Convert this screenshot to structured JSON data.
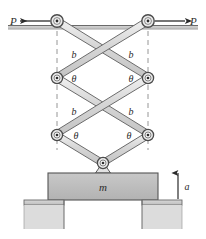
{
  "figure": {
    "labels": {
      "force_left": "P",
      "force_right": "P",
      "link_length": "b",
      "angle": "θ",
      "mass": "m",
      "acceleration": "a"
    },
    "annotations": {
      "b_labels": [
        "b",
        "b",
        "b",
        "b"
      ],
      "theta_labels": [
        "θ",
        "θ",
        "θ",
        "θ"
      ],
      "force_labels": [
        "P",
        "P"
      ]
    },
    "colors": {
      "link_fill": "#d3d3d3",
      "link_stroke": "#6b6b6b",
      "block_fill": "#b9b9b9",
      "block_stroke": "#555555",
      "ground_fill": "#c9c9c9",
      "ground_stroke": "#666666",
      "ink": "#2b2b2b",
      "dashed": "#8a8a8a",
      "background": "#ffffff"
    },
    "geometry": {
      "top_joints": [
        [
          57,
          21
        ],
        [
          148,
          21
        ]
      ],
      "mid_joints": [
        [
          57,
          78
        ],
        [
          148,
          78
        ]
      ],
      "low_joints": [
        [
          57,
          135
        ],
        [
          148,
          135
        ]
      ],
      "bottom_pivot": [
        103,
        163
      ],
      "block_rect": [
        48,
        173,
        110,
        27
      ],
      "ceiling_y": 28,
      "floor_y": 200
    }
  }
}
